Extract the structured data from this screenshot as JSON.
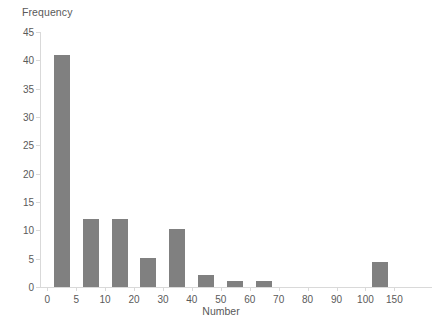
{
  "chart_data": {
    "type": "bar",
    "title": "",
    "xlabel": "Number",
    "ylabel": "Frequency",
    "ylim": [
      0,
      45
    ],
    "ytick_step": 5,
    "yticks": [
      0,
      5,
      10,
      15,
      20,
      25,
      30,
      35,
      40,
      45
    ],
    "xticks": [
      0,
      5,
      10,
      20,
      30,
      40,
      50,
      60,
      70,
      80,
      90,
      100,
      150
    ],
    "xtick_labels": [
      "0",
      "5",
      "10",
      "20",
      "30",
      "40",
      "50",
      "60",
      "70",
      "80",
      "90",
      "100",
      "150"
    ],
    "grid": false,
    "legend": null,
    "bar_color": "#808080",
    "axis_color": "#d9d9d9",
    "text_color": "#595959",
    "categories": [
      "0-5",
      "5-10",
      "10-20",
      "20-30",
      "30-40",
      "40-50",
      "50-60",
      "60-70",
      "70-80",
      "80-90",
      "90-100",
      "100-150"
    ],
    "values": [
      41,
      12,
      12,
      5.2,
      10.3,
      2.2,
      1.1,
      1.1,
      0,
      0,
      0,
      4.4
    ],
    "bars": [
      {
        "label": "0-5",
        "value": 41,
        "slot": 0
      },
      {
        "label": "5-10",
        "value": 12,
        "slot": 1
      },
      {
        "label": "10-20",
        "value": 12,
        "slot": 2
      },
      {
        "label": "20-30",
        "value": 5.2,
        "slot": 3
      },
      {
        "label": "30-40",
        "value": 10.3,
        "slot": 4
      },
      {
        "label": "40-50",
        "value": 2.2,
        "slot": 5
      },
      {
        "label": "50-60",
        "value": 1.1,
        "slot": 6
      },
      {
        "label": "60-70",
        "value": 1.1,
        "slot": 7
      },
      {
        "label": "70-80",
        "value": 0,
        "slot": 8
      },
      {
        "label": "80-90",
        "value": 0,
        "slot": 9
      },
      {
        "label": "90-100",
        "value": 0,
        "slot": 10
      },
      {
        "label": "100-150",
        "value": 4.4,
        "slot": 11
      }
    ]
  }
}
